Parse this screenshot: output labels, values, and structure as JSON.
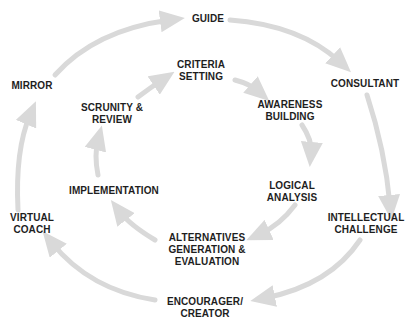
{
  "diagram": {
    "type": "two concentric cycles",
    "arrow_color": "#d9d9d9",
    "text_color": "#1e1e1e",
    "outer_cycle": {
      "direction": "clockwise",
      "nodes": [
        {
          "id": "guide",
          "lines": [
            "GUIDE"
          ]
        },
        {
          "id": "consultant",
          "lines": [
            "CONSULTANT"
          ]
        },
        {
          "id": "intellectual-challenge",
          "lines": [
            "INTELLECTUAL",
            "CHALLENGE"
          ]
        },
        {
          "id": "encourager-creator",
          "lines": [
            "ENCOURAGER/",
            "CREATOR"
          ]
        },
        {
          "id": "virtual-coach",
          "lines": [
            "VIRTUAL",
            "COACH"
          ]
        },
        {
          "id": "mirror",
          "lines": [
            "MIRROR"
          ]
        }
      ]
    },
    "inner_cycle": {
      "direction": "clockwise",
      "nodes": [
        {
          "id": "criteria-setting",
          "lines": [
            "CRITERIA",
            "SETTING"
          ]
        },
        {
          "id": "awareness-building",
          "lines": [
            "AWARENESS",
            "BUILDING"
          ]
        },
        {
          "id": "logical-analysis",
          "lines": [
            "LOGICAL",
            "ANALYSIS"
          ]
        },
        {
          "id": "alternatives",
          "lines": [
            "ALTERNATIVES",
            "GENERATION &",
            "EVALUATION"
          ]
        },
        {
          "id": "implementation",
          "lines": [
            "IMPLEMENTATION"
          ]
        },
        {
          "id": "scrunity-review",
          "lines": [
            "SCRUNITY &",
            "REVIEW"
          ]
        }
      ]
    }
  }
}
